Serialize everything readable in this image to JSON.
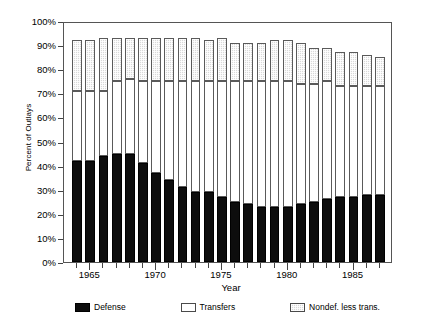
{
  "chart_data": {
    "type": "bar",
    "stacked": true,
    "title": "",
    "xlabel": "Year",
    "ylabel": "Percent of Outlays",
    "ylim": [
      0,
      100
    ],
    "ytick_labels": [
      "0%",
      "10%",
      "20%",
      "30%",
      "40%",
      "50%",
      "60%",
      "70%",
      "80%",
      "90%",
      "100%"
    ],
    "ytick_values": [
      0,
      10,
      20,
      30,
      40,
      50,
      60,
      70,
      80,
      90,
      100
    ],
    "xtick_labels": [
      "1965",
      "1970",
      "1975",
      "1980",
      "1985"
    ],
    "xtick_values": [
      1965,
      1970,
      1975,
      1980,
      1985
    ],
    "grid": false,
    "legend_position": "bottom",
    "categories": [
      1964,
      1965,
      1966,
      1967,
      1968,
      1969,
      1970,
      1971,
      1972,
      1973,
      1974,
      1975,
      1976,
      1977,
      1978,
      1979,
      1980,
      1981,
      1982,
      1983,
      1984,
      1985,
      1986,
      1987
    ],
    "series": [
      {
        "name": "Defense",
        "color": "#0d0d0d",
        "values": [
          42,
          42,
          44,
          45,
          45,
          41,
          37,
          34,
          31,
          29,
          29,
          27,
          25,
          24,
          23,
          23,
          23,
          24,
          25,
          26,
          27,
          27,
          28,
          28
        ]
      },
      {
        "name": "Transfers",
        "color": "#ffffff",
        "values": [
          29,
          29,
          27,
          30,
          31,
          34,
          38,
          41,
          44,
          46,
          46,
          48,
          50,
          51,
          52,
          52,
          52,
          50,
          49,
          49,
          46,
          46,
          45,
          45
        ]
      },
      {
        "name": "Nondef. less trans.",
        "color": "#d9d9d9",
        "values": [
          21,
          21,
          22,
          18,
          17,
          18,
          18,
          18,
          18,
          18,
          17,
          18,
          16,
          16,
          16,
          17,
          17,
          17,
          15,
          14,
          14,
          14,
          13,
          12
        ]
      }
    ],
    "legend": [
      {
        "label": "Defense",
        "swatch": "defense"
      },
      {
        "label": "Transfers",
        "swatch": "transfers"
      },
      {
        "label": "Nondef. less trans.",
        "swatch": "nondef"
      }
    ]
  }
}
